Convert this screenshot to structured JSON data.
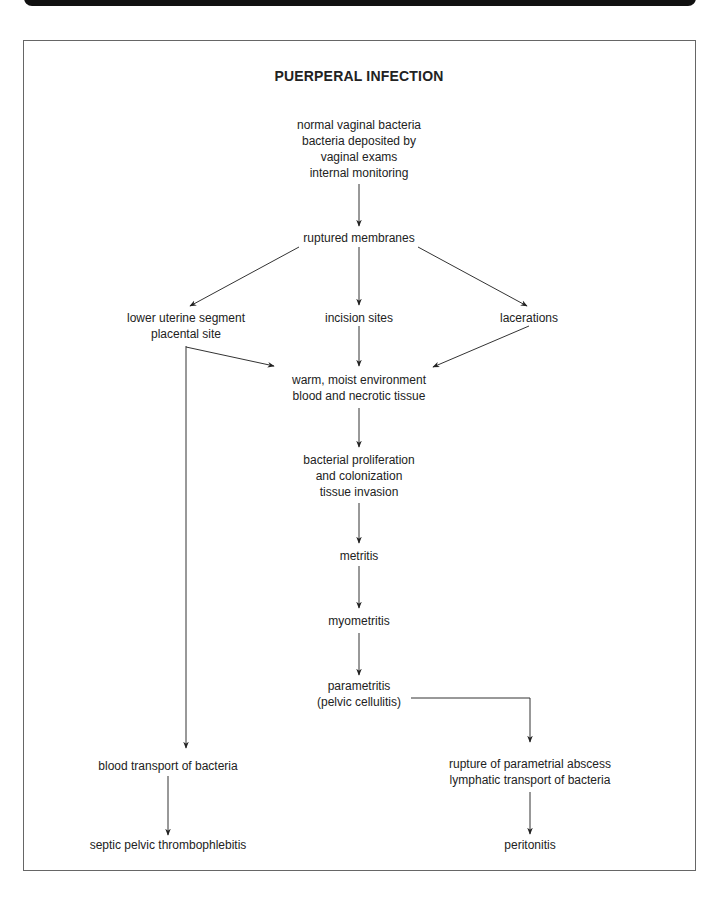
{
  "title": "PUERPERAL INFECTION",
  "nodes": {
    "sources": [
      "normal vaginal bacteria",
      "bacteria deposited by",
      "vaginal exams",
      "internal monitoring"
    ],
    "ruptured": "ruptured membranes",
    "lower_uterine": [
      "lower uterine segment",
      "placental site"
    ],
    "incision": "incision sites",
    "lacerations": "lacerations",
    "environment": [
      "warm, moist environment",
      "blood and necrotic tissue"
    ],
    "proliferation": [
      "bacterial proliferation",
      "and colonization",
      "tissue invasion"
    ],
    "metritis": "metritis",
    "myometritis": "myometritis",
    "parametritis": [
      "parametritis",
      "(pelvic cellulitis)"
    ],
    "blood_transport": "blood transport of bacteria",
    "septic": "septic pelvic thrombophlebitis",
    "rupture_abscess": [
      "rupture of parametrial abscess",
      "lymphatic transport of bacteria"
    ],
    "peritonitis": "peritonitis"
  },
  "edges": [
    [
      "sources",
      "ruptured"
    ],
    [
      "ruptured",
      "lower_uterine"
    ],
    [
      "ruptured",
      "incision"
    ],
    [
      "ruptured",
      "lacerations"
    ],
    [
      "lower_uterine",
      "environment"
    ],
    [
      "incision",
      "environment"
    ],
    [
      "lacerations",
      "environment"
    ],
    [
      "environment",
      "proliferation"
    ],
    [
      "proliferation",
      "metritis"
    ],
    [
      "metritis",
      "myometritis"
    ],
    [
      "myometritis",
      "parametritis"
    ],
    [
      "lower_uterine",
      "blood_transport"
    ],
    [
      "blood_transport",
      "septic"
    ],
    [
      "parametritis",
      "rupture_abscess"
    ],
    [
      "rupture_abscess",
      "peritonitis"
    ]
  ]
}
